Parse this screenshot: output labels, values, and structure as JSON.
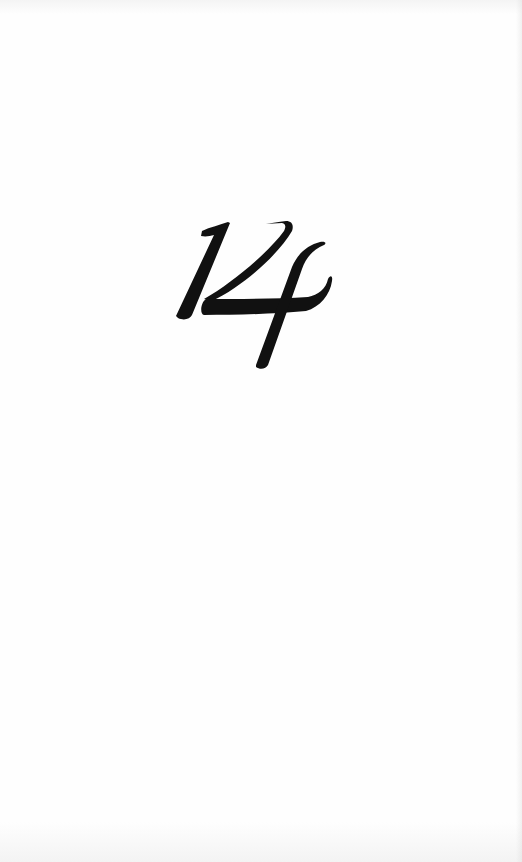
{
  "page": {
    "type": "chapter-opener",
    "chapter_number": "14",
    "background_color": "#fefefe",
    "ink_color": "#111111"
  }
}
